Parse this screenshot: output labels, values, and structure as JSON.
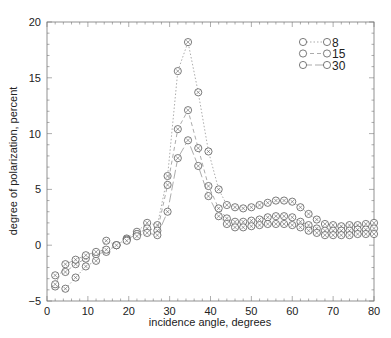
{
  "chart_data": {
    "type": "line",
    "title": "",
    "xlabel": "incidence angle, degrees",
    "ylabel": "degree of polarization, percent",
    "xlim": [
      0,
      80
    ],
    "ylim": [
      -5,
      20
    ],
    "xticks": [
      0,
      10,
      20,
      30,
      40,
      50,
      60,
      70,
      80
    ],
    "yticks": [
      -5,
      0,
      5,
      10,
      15,
      20
    ],
    "grid": false,
    "legend_position": "upper right",
    "x": [
      2,
      4.5,
      7,
      9.5,
      12,
      14.5,
      17,
      19.5,
      22,
      24.5,
      27,
      29.5,
      32,
      34.5,
      37,
      39.5,
      42,
      44,
      46,
      48,
      50,
      52,
      54,
      56,
      58,
      60,
      62,
      64,
      66,
      68,
      70,
      72,
      74,
      76,
      78,
      80
    ],
    "series": [
      {
        "name": "8",
        "dash": "1.5,2",
        "values": [
          -3.7,
          -3.9,
          -2.9,
          -1.9,
          -1.4,
          0.4,
          0.0,
          0.6,
          1.2,
          2.0,
          1.8,
          6.2,
          15.6,
          18.2,
          13.7,
          8.4,
          5.0,
          3.6,
          3.4,
          3.3,
          3.4,
          3.6,
          3.8,
          4.0,
          4.0,
          3.9,
          3.4,
          2.8,
          2.3,
          1.9,
          1.8,
          1.7,
          1.8,
          1.8,
          1.9,
          2.0
        ]
      },
      {
        "name": "15",
        "dash": "4,3",
        "values": [
          -2.7,
          -2.4,
          -1.7,
          -1.2,
          -0.8,
          -0.6,
          0.0,
          0.5,
          1.0,
          1.5,
          1.3,
          5.4,
          10.4,
          12.1,
          8.7,
          5.3,
          3.3,
          2.4,
          2.1,
          2.1,
          2.2,
          2.3,
          2.5,
          2.6,
          2.6,
          2.5,
          2.1,
          1.8,
          1.5,
          1.3,
          1.3,
          1.3,
          1.3,
          1.4,
          1.4,
          1.5
        ]
      },
      {
        "name": "30",
        "dash": "9,3",
        "values": [
          -3.5,
          -1.7,
          -1.3,
          -0.9,
          -0.6,
          -0.4,
          0.0,
          0.4,
          0.8,
          1.1,
          0.9,
          3.0,
          7.8,
          9.4,
          7.1,
          4.4,
          2.6,
          1.9,
          1.6,
          1.6,
          1.7,
          1.8,
          1.9,
          1.9,
          1.9,
          1.8,
          1.6,
          1.3,
          1.1,
          0.9,
          0.9,
          0.9,
          0.9,
          1.0,
          1.0,
          1.0
        ]
      }
    ]
  },
  "colors": {
    "axis": "#777777",
    "line": "#888888",
    "marker": "#444444",
    "text": "#222222"
  }
}
